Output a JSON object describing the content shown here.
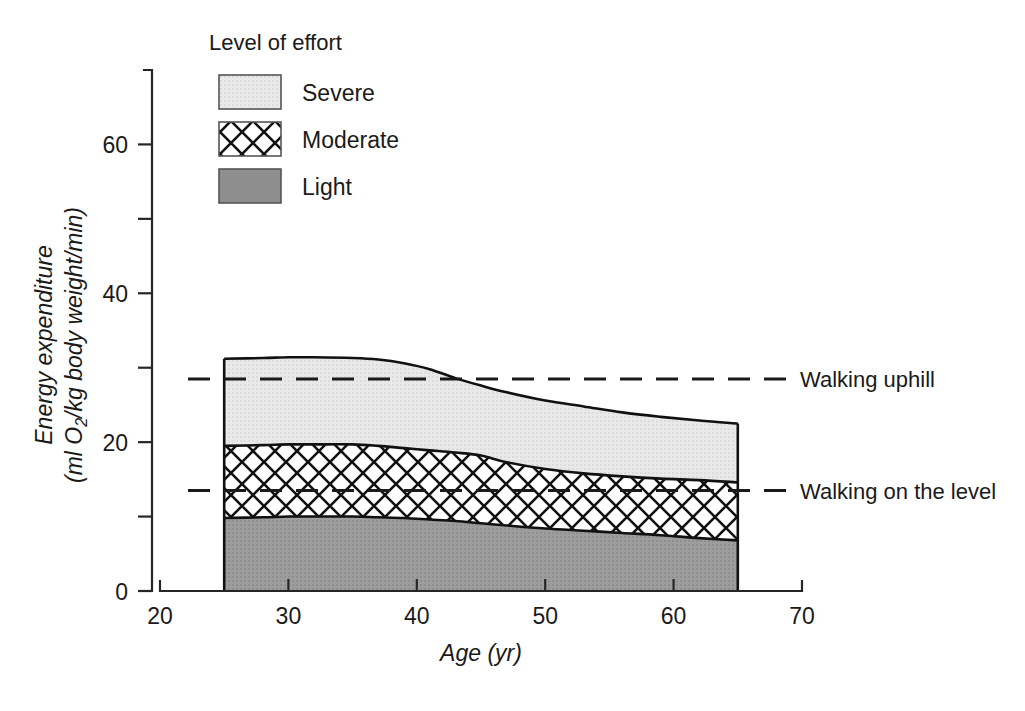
{
  "chart_data": {
    "type": "area",
    "title": "",
    "xlabel": "Age (yr)",
    "ylabel": "Energy expenditure (ml O2/kg body weight/min)",
    "ylabel_line1": "Energy expenditure",
    "ylabel_line2_pre": "(ml O",
    "ylabel_line2_sub": "2",
    "ylabel_line2_post": "/kg body weight/min)",
    "xlim": [
      20,
      70
    ],
    "ylim": [
      0,
      70
    ],
    "xticks": [
      20,
      30,
      40,
      50,
      60,
      70
    ],
    "xtick_labels": [
      "20",
      "30",
      "40",
      "50",
      "60",
      "70"
    ],
    "yticks": [
      0,
      20,
      40,
      60
    ],
    "ytick_labels": [
      "0",
      "20",
      "40",
      "60"
    ],
    "yminorticks": [
      10,
      30,
      50,
      70
    ],
    "grid": false,
    "legend_position": "top-left-inside",
    "stacked": true,
    "x": [
      25,
      28,
      30,
      32,
      35,
      37,
      39,
      41,
      43,
      45,
      47,
      50,
      53,
      56,
      59,
      62,
      65
    ],
    "series": [
      {
        "name": "Light",
        "fill": "solid-gray",
        "color": "#9a9a9a",
        "values": [
          9.8,
          9.9,
          10.0,
          10.0,
          10.0,
          9.9,
          9.8,
          9.6,
          9.4,
          9.1,
          8.8,
          8.4,
          8.1,
          7.8,
          7.5,
          7.1,
          6.8
        ]
      },
      {
        "name": "Moderate",
        "fill": "crosshatch",
        "color": "#ffffff",
        "cumulative_top": [
          19.5,
          19.6,
          19.7,
          19.7,
          19.7,
          19.5,
          19.2,
          18.9,
          18.6,
          18.2,
          17.3,
          16.4,
          15.8,
          15.4,
          15.1,
          14.9,
          14.6
        ]
      },
      {
        "name": "Severe",
        "fill": "light-gray",
        "color": "#e6e6e6",
        "cumulative_top": [
          31.2,
          31.3,
          31.4,
          31.4,
          31.3,
          31.1,
          30.6,
          29.8,
          28.6,
          27.6,
          26.7,
          25.6,
          24.8,
          24.0,
          23.4,
          22.9,
          22.5
        ]
      }
    ],
    "reference_lines": [
      {
        "label": "Walking uphill",
        "value": 28.5
      },
      {
        "label": "Walking on the level",
        "value": 13.5
      }
    ],
    "legend": {
      "title": "Level of effort",
      "items": [
        {
          "label": "Severe",
          "swatch": "light-gray"
        },
        {
          "label": "Moderate",
          "swatch": "crosshatch"
        },
        {
          "label": "Light",
          "swatch": "solid-gray"
        }
      ]
    },
    "colors": {
      "severe": "#e6e6e6",
      "moderate": "#ffffff",
      "light": "#9a9a9a",
      "outline": "#111111",
      "axis": "#262626",
      "text": "#1a1a1a"
    }
  }
}
